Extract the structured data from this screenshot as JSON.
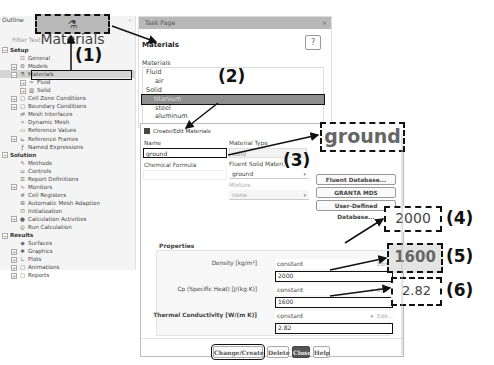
{
  "outline": {
    "title": "Outline",
    "filter_placeholder": "Filter Text",
    "tree": [
      {
        "label": "Setup",
        "level": 0,
        "expander": "−",
        "icon": "",
        "section": true
      },
      {
        "label": "General",
        "level": 1,
        "expander": "",
        "icon": "general-icon"
      },
      {
        "label": "Models",
        "level": 1,
        "expander": "+",
        "icon": "models-icon"
      },
      {
        "label": "Materials",
        "level": 1,
        "expander": "−",
        "icon": "materials-icon",
        "selected": true
      },
      {
        "label": "Fluid",
        "level": 2,
        "expander": "+",
        "icon": "fluid-icon"
      },
      {
        "label": "Solid",
        "level": 2,
        "expander": "+",
        "icon": "solid-icon"
      },
      {
        "label": "Cell Zone Conditions",
        "level": 1,
        "expander": "+",
        "icon": "cell-zone-icon"
      },
      {
        "label": "Boundary Conditions",
        "level": 1,
        "expander": "+",
        "icon": "boundary-icon"
      },
      {
        "label": "Mesh Interfaces",
        "level": 1,
        "expander": "",
        "icon": "mesh-interfaces-icon"
      },
      {
        "label": "Dynamic Mesh",
        "level": 1,
        "expander": "",
        "icon": "dynamic-mesh-icon"
      },
      {
        "label": "Reference Values",
        "level": 1,
        "expander": "",
        "icon": "reference-values-icon"
      },
      {
        "label": "Reference Frames",
        "level": 1,
        "expander": "+",
        "icon": "reference-frames-icon"
      },
      {
        "label": "Named Expressions",
        "level": 1,
        "expander": "",
        "icon": "named-expressions-icon"
      },
      {
        "label": "Solution",
        "level": 0,
        "expander": "−",
        "icon": "",
        "section": true
      },
      {
        "label": "Methods",
        "level": 1,
        "expander": "",
        "icon": "methods-icon"
      },
      {
        "label": "Controls",
        "level": 1,
        "expander": "",
        "icon": "controls-icon"
      },
      {
        "label": "Report Definitions",
        "level": 1,
        "expander": "",
        "icon": "report-definitions-icon"
      },
      {
        "label": "Monitors",
        "level": 1,
        "expander": "+",
        "icon": "monitors-icon"
      },
      {
        "label": "Cell Registers",
        "level": 1,
        "expander": "",
        "icon": "cell-registers-icon"
      },
      {
        "label": "Automatic Mesh Adaption",
        "level": 1,
        "expander": "",
        "icon": "mesh-adaption-icon"
      },
      {
        "label": "Initialization",
        "level": 1,
        "expander": "",
        "icon": "initialization-icon"
      },
      {
        "label": "Calculation Activities",
        "level": 1,
        "expander": "+",
        "icon": "calculation-activities-icon"
      },
      {
        "label": "Run Calculation",
        "level": 1,
        "expander": "",
        "icon": "run-calculation-icon"
      },
      {
        "label": "Results",
        "level": 0,
        "expander": "−",
        "icon": "",
        "section": true
      },
      {
        "label": "Surfaces",
        "level": 1,
        "expander": "",
        "icon": "surfaces-icon"
      },
      {
        "label": "Graphics",
        "level": 1,
        "expander": "+",
        "icon": "graphics-icon"
      },
      {
        "label": "Plots",
        "level": 1,
        "expander": "+",
        "icon": "plots-icon"
      },
      {
        "label": "Animations",
        "level": 1,
        "expander": "+",
        "icon": "animations-icon"
      },
      {
        "label": "Reports",
        "level": 1,
        "expander": "+",
        "icon": "reports-icon"
      }
    ]
  },
  "task_page": {
    "header": "Task Page",
    "title": "Materials",
    "help_glyph": "?",
    "list_label": "Materials",
    "materials": [
      {
        "label": "Fluid",
        "child": false
      },
      {
        "label": "air",
        "child": true
      },
      {
        "label": "Solid",
        "child": false
      },
      {
        "label": "titanium",
        "child": true,
        "selected": true
      },
      {
        "label": "steel",
        "child": true
      },
      {
        "label": "aluminum",
        "child": true
      }
    ]
  },
  "dialog": {
    "title": "Create/Edit Materials",
    "name_label": "Name",
    "name_value": "ground",
    "chemical_formula_label": "Chemical Formula",
    "chemical_formula_value": "",
    "material_type_label": "Material Type",
    "material_type_value": "solid",
    "fluent_solid_label": "Fluent Solid Materi.",
    "fluent_solid_value": "ground",
    "mixture_label": "Mixture",
    "mixture_value": "none",
    "db_buttons": [
      "Fluent Database...",
      "GRANTA MDS Database...",
      "User-Defined Database..."
    ],
    "properties_title": "Properties",
    "properties": [
      {
        "label": "Density [kg/m³]",
        "method": "constant",
        "value": "2000",
        "edit": "Edit..."
      },
      {
        "label": "Cp (Specific Heat) [J/(kg K)]",
        "method": "constant",
        "value": "1600",
        "edit": "Edit..."
      },
      {
        "label": "Thermal Conductivity [W/(m K)]",
        "method": "constant",
        "value": "2.82",
        "edit": "Edit..."
      }
    ],
    "buttons": {
      "change_create": "Change/Create",
      "delete": "Delete",
      "close": "Close",
      "help": "Help"
    }
  },
  "annotations": {
    "materials_zoom": "Materials",
    "name_zoom": "ground",
    "density_zoom": "2000",
    "cp_zoom": "1600",
    "k_zoom": "2.82",
    "tags": [
      "(1)",
      "(2)",
      "(3)",
      "(4)",
      "(5)",
      "(6)"
    ]
  }
}
